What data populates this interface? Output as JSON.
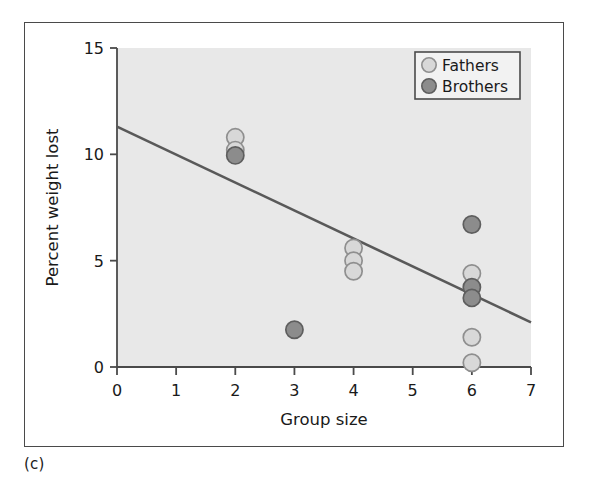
{
  "panel": {
    "label": "(c)"
  },
  "chart_data": {
    "type": "scatter",
    "title": "",
    "xlabel": "Group size",
    "ylabel": "Percent weight lost",
    "xlim": [
      0,
      7
    ],
    "ylim": [
      0,
      15
    ],
    "xticks": [
      0,
      1,
      2,
      3,
      4,
      5,
      6,
      7
    ],
    "xtick_labels": [
      "0",
      "1",
      "2",
      "3",
      "4",
      "5",
      "6",
      "7"
    ],
    "yticks": [
      0,
      5,
      10,
      15
    ],
    "ytick_labels": [
      "0",
      "5",
      "10",
      "15"
    ],
    "grid": false,
    "plot_background": "#e8e8e8",
    "legend": {
      "position": "top-right",
      "entries": [
        {
          "name": "Fathers",
          "marker": "circle",
          "fill": "#d8d8d8",
          "edge": "#8f8f8f"
        },
        {
          "name": "Brothers",
          "marker": "circle",
          "fill": "#8c8c8c",
          "edge": "#5e5e5e"
        }
      ]
    },
    "series": [
      {
        "name": "Fathers",
        "fill": "#d8d8d8",
        "edge": "#8f8f8f",
        "points": [
          {
            "x": 2,
            "y": 10.8
          },
          {
            "x": 2,
            "y": 10.2
          },
          {
            "x": 4,
            "y": 5.6
          },
          {
            "x": 4,
            "y": 5.0
          },
          {
            "x": 4,
            "y": 4.5
          },
          {
            "x": 6,
            "y": 4.4
          },
          {
            "x": 6,
            "y": 1.4
          },
          {
            "x": 6,
            "y": 0.2
          }
        ]
      },
      {
        "name": "Brothers",
        "fill": "#8c8c8c",
        "edge": "#5e5e5e",
        "points": [
          {
            "x": 2,
            "y": 9.95
          },
          {
            "x": 3,
            "y": 1.75
          },
          {
            "x": 6,
            "y": 6.7
          },
          {
            "x": 6,
            "y": 3.75
          },
          {
            "x": 6,
            "y": 3.25
          }
        ]
      }
    ],
    "regression_line": {
      "color": "#595959",
      "x_start": 0,
      "y_start": 11.3,
      "x_end": 7,
      "y_end": 2.1
    }
  }
}
